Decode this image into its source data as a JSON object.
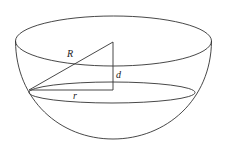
{
  "diagram": {
    "labels": {
      "R": "R",
      "d": "d",
      "r": "r"
    },
    "colors": {
      "stroke": "#333333",
      "background": "#ffffff"
    }
  }
}
